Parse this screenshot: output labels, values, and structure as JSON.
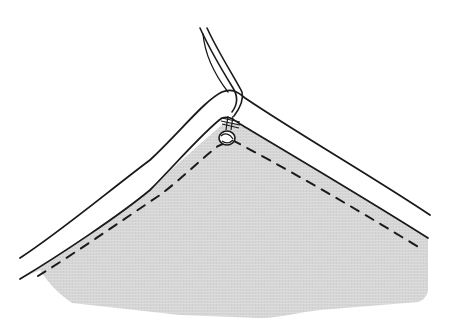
{
  "illustration": {
    "subject": "fabric corner with stay-stitched seam allowance and thread tail tied off at the corner point",
    "colors": {
      "background": "#ffffff",
      "fabric": "#d9d9d9",
      "line": "#1a1a1a",
      "binding": "#ffffff"
    },
    "elements": [
      "fabric-piece",
      "folded-edge-binding",
      "dashed-stitch-line",
      "thread-tail",
      "thread-knot"
    ]
  }
}
